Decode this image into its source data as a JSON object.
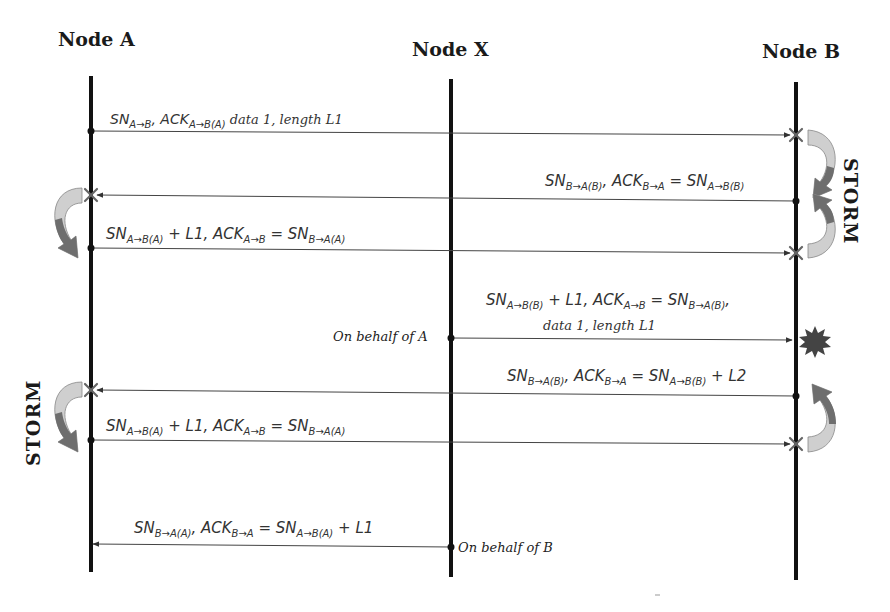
{
  "diagram": {
    "type": "sequence",
    "nodes": [
      {
        "id": "A",
        "label": "Node A",
        "x": 91
      },
      {
        "id": "X",
        "label": "Node X",
        "x": 451
      },
      {
        "id": "B",
        "label": "Node B",
        "x": 796
      }
    ],
    "messages": [
      {
        "from": "A",
        "to": "B",
        "y_from": 131,
        "y_to": 135,
        "dropped": true,
        "parts": [
          [
            "SN",
            "A→B"
          ],
          [
            ", ACK",
            "A→B(A)"
          ],
          [
            " data 1, length L1",
            ""
          ]
        ]
      },
      {
        "from": "B",
        "to": "A",
        "y_from": 201,
        "y_to": 195,
        "dropped": true,
        "parts": [
          [
            "SN",
            "B→A(B)"
          ],
          [
            ", ACK",
            "B→A"
          ],
          [
            " = SN",
            "A→B(B)"
          ]
        ]
      },
      {
        "from": "A",
        "to": "B",
        "y_from": 248,
        "y_to": 253,
        "dropped": true,
        "parts": [
          [
            "SN",
            "A→B(A)"
          ],
          [
            " + L1, ACK",
            "A→B"
          ],
          [
            " = SN",
            "B→A(A)"
          ]
        ]
      },
      {
        "from": "X",
        "to": "B",
        "y_from": 338,
        "y_to": 340,
        "dropped": false,
        "note": "On behalf of A",
        "parts": [
          [
            "SN",
            "A→B(B)"
          ],
          [
            " + L1, ACK",
            "A→B"
          ],
          [
            " = SN",
            "B→A(B)"
          ],
          [
            ",",
            ""
          ]
        ],
        "line2": "data 1, length L1"
      },
      {
        "from": "B",
        "to": "A",
        "y_from": 396,
        "y_to": 390,
        "dropped": true,
        "parts": [
          [
            "SN",
            "B→A(B)"
          ],
          [
            ", ACK",
            "B→A"
          ],
          [
            " = SN",
            "A→B(B)"
          ],
          [
            " + L2",
            ""
          ]
        ]
      },
      {
        "from": "A",
        "to": "B",
        "y_from": 440,
        "y_to": 444,
        "dropped": true,
        "parts": [
          [
            "SN",
            "A→B(A)"
          ],
          [
            " + L1, ACK",
            "A→B"
          ],
          [
            " = SN",
            "B→A(A)"
          ]
        ]
      },
      {
        "from": "X",
        "to": "A",
        "y_from": 547,
        "y_to": 544,
        "dropped": false,
        "note": "On behalf of B",
        "parts": [
          [
            "SN",
            "B→A(A)"
          ],
          [
            ", ACK",
            "B→A"
          ],
          [
            " = SN",
            "A→B(A)"
          ],
          [
            " + L1",
            ""
          ]
        ]
      }
    ],
    "storm_labels": [
      {
        "side": "right",
        "text": "STORM"
      },
      {
        "side": "left",
        "text": "STORM"
      }
    ],
    "side_notes": {
      "on_behalf_a": "On behalf of A",
      "on_behalf_b": "On behalf of B"
    },
    "labels": {
      "m1": {
        "sn": "SN",
        "sn_sub": "A→B",
        "ack": ", ACK",
        "ack_sub": "A→B(A)",
        "tail": " data 1, length L1"
      },
      "m2": {
        "sn": "SN",
        "sn_sub": "B→A(B)",
        "ack": ", ACK",
        "ack_sub": "B→A",
        "eq": " = SN",
        "eq_sub": "A→B(B)"
      },
      "m3": {
        "sn": "SN",
        "sn_sub": "A→B(A)",
        "ack": " + L1, ACK",
        "ack_sub": "A→B",
        "eq": " = SN",
        "eq_sub": "B→A(A)"
      },
      "m4": {
        "sn": "SN",
        "sn_sub": "A→B(B)",
        "ack": " + L1, ACK",
        "ack_sub": "A→B",
        "eq": " = SN",
        "eq_sub": "B→A(B)",
        "tail": ",",
        "line2": "data 1, length L1"
      },
      "m5": {
        "sn": "SN",
        "sn_sub": "B→A(B)",
        "ack": ", ACK",
        "ack_sub": "B→A",
        "eq": " = SN",
        "eq_sub": "A→B(B)",
        "tail": " + L2"
      },
      "m6": {
        "sn": "SN",
        "sn_sub": "A→B(A)",
        "ack": " + L1, ACK",
        "ack_sub": "A→B",
        "eq": " = SN",
        "eq_sub": "B→A(A)"
      },
      "m7": {
        "sn": "SN",
        "sn_sub": "B→A(A)",
        "ack": ", ACK",
        "ack_sub": "B→A",
        "eq": " = SN",
        "eq_sub": "A→B(A)",
        "tail": " + L1"
      }
    },
    "colors": {
      "line": "#111111",
      "arrow": "#444444",
      "cross": "#666666",
      "arc_light": "#cfcfcf",
      "arc_dark": "#6e6e6e",
      "burst": "#444444"
    }
  }
}
